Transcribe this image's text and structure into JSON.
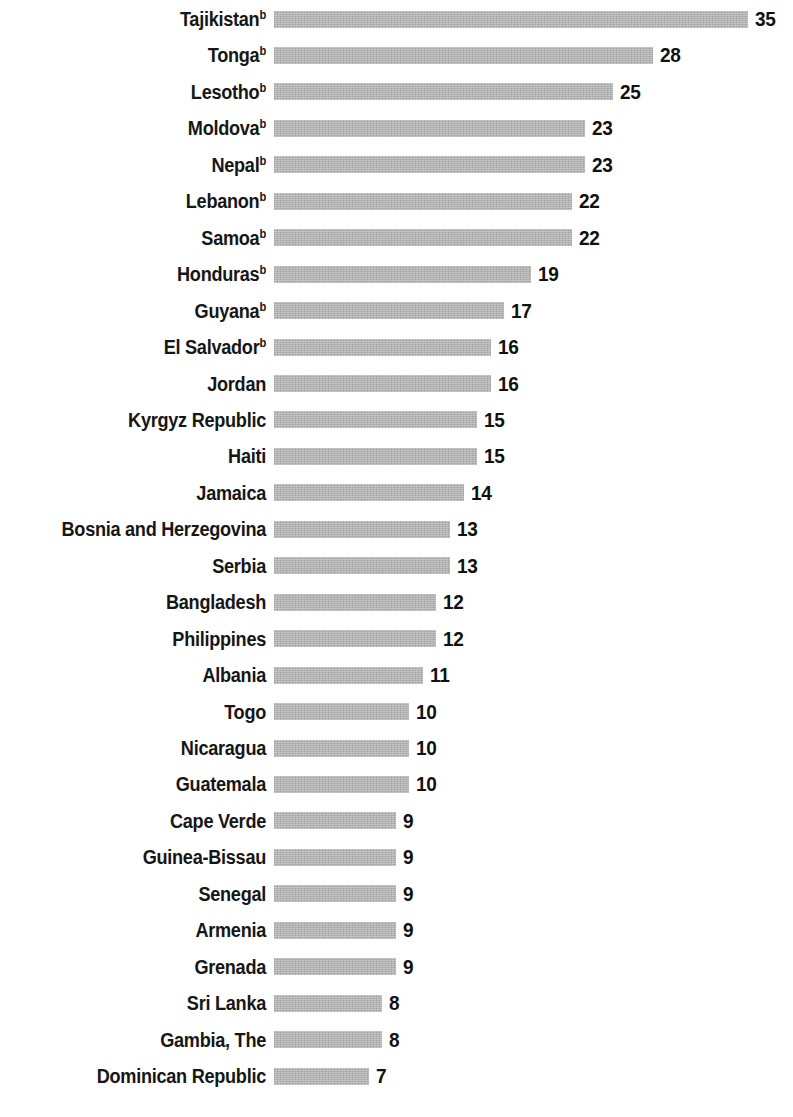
{
  "chart_data": {
    "type": "bar",
    "orientation": "horizontal",
    "title": "",
    "subtitle": "",
    "xlabel": "",
    "ylabel": "",
    "xlim": [
      0,
      35
    ],
    "grid": false,
    "legend": null,
    "bar_color": "#b3b3b3",
    "label_color": "#161616",
    "value_color": "#101010",
    "value_labels_shown": true,
    "footnote_marker": "b",
    "categories": [
      "Tajikistan",
      "Tonga",
      "Lesotho",
      "Moldova",
      "Nepal",
      "Lebanon",
      "Samoa",
      "Honduras",
      "Guyana",
      "El Salvador",
      "Jordan",
      "Kyrgyz Republic",
      "Haiti",
      "Jamaica",
      "Bosnia and Herzegovina",
      "Serbia",
      "Bangladesh",
      "Philippines",
      "Albania",
      "Togo",
      "Nicaragua",
      "Guatemala",
      "Cape Verde",
      "Guinea-Bissau",
      "Senegal",
      "Armenia",
      "Grenada",
      "Sri Lanka",
      "Gambia, The",
      "Dominican Republic"
    ],
    "values": [
      35,
      28,
      25,
      23,
      23,
      22,
      22,
      19,
      17,
      16,
      16,
      15,
      15,
      14,
      13,
      13,
      12,
      12,
      11,
      10,
      10,
      10,
      9,
      9,
      9,
      9,
      9,
      8,
      8,
      7
    ]
  },
  "rows": [
    {
      "label": "Tajikistan",
      "sup": "b",
      "value": 35,
      "value_text": "35"
    },
    {
      "label": "Tonga",
      "sup": "b",
      "value": 28,
      "value_text": "28"
    },
    {
      "label": "Lesotho",
      "sup": "b",
      "value": 25,
      "value_text": "25"
    },
    {
      "label": "Moldova",
      "sup": "b",
      "value": 23,
      "value_text": "23"
    },
    {
      "label": "Nepal",
      "sup": "b",
      "value": 23,
      "value_text": "23"
    },
    {
      "label": "Lebanon",
      "sup": "b",
      "value": 22,
      "value_text": "22"
    },
    {
      "label": "Samoa",
      "sup": "b",
      "value": 22,
      "value_text": "22"
    },
    {
      "label": "Honduras",
      "sup": "b",
      "value": 19,
      "value_text": "19"
    },
    {
      "label": "Guyana",
      "sup": "b",
      "value": 17,
      "value_text": "17"
    },
    {
      "label": "El Salvador",
      "sup": "b",
      "value": 16,
      "value_text": "16"
    },
    {
      "label": "Jordan",
      "sup": "",
      "value": 16,
      "value_text": "16"
    },
    {
      "label": "Kyrgyz Republic",
      "sup": "",
      "value": 15,
      "value_text": "15"
    },
    {
      "label": "Haiti",
      "sup": "",
      "value": 15,
      "value_text": "15"
    },
    {
      "label": "Jamaica",
      "sup": "",
      "value": 14,
      "value_text": "14"
    },
    {
      "label": "Bosnia and Herzegovina",
      "sup": "",
      "value": 13,
      "value_text": "13"
    },
    {
      "label": "Serbia",
      "sup": "",
      "value": 13,
      "value_text": "13"
    },
    {
      "label": "Bangladesh",
      "sup": "",
      "value": 12,
      "value_text": "12"
    },
    {
      "label": "Philippines",
      "sup": "",
      "value": 12,
      "value_text": "12"
    },
    {
      "label": "Albania",
      "sup": "",
      "value": 11,
      "value_text": "11"
    },
    {
      "label": "Togo",
      "sup": "",
      "value": 10,
      "value_text": "10"
    },
    {
      "label": "Nicaragua",
      "sup": "",
      "value": 10,
      "value_text": "10"
    },
    {
      "label": "Guatemala",
      "sup": "",
      "value": 10,
      "value_text": "10"
    },
    {
      "label": "Cape Verde",
      "sup": "",
      "value": 9,
      "value_text": "9"
    },
    {
      "label": "Guinea-Bissau",
      "sup": "",
      "value": 9,
      "value_text": "9"
    },
    {
      "label": "Senegal",
      "sup": "",
      "value": 9,
      "value_text": "9"
    },
    {
      "label": "Armenia",
      "sup": "",
      "value": 9,
      "value_text": "9"
    },
    {
      "label": "Grenada",
      "sup": "",
      "value": 9,
      "value_text": "9"
    },
    {
      "label": "Sri Lanka",
      "sup": "",
      "value": 8,
      "value_text": "8"
    },
    {
      "label": "Gambia, The",
      "sup": "",
      "value": 8,
      "value_text": "8"
    },
    {
      "label": "Dominican Republic",
      "sup": "",
      "value": 7,
      "value_text": "7"
    }
  ],
  "layout": {
    "bar_origin_x": 274,
    "px_per_unit": 13.54,
    "row_pitch": 36.45,
    "first_row_center_y": 19,
    "bar_height": 17
  }
}
